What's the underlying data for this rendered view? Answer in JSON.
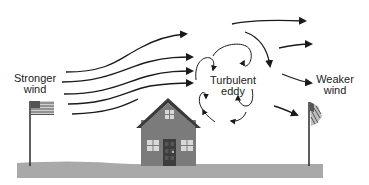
{
  "diagram": {
    "type": "illustration",
    "labels": {
      "stronger_wind": {
        "line1": "Stronger",
        "line2": "wind"
      },
      "turbulent_eddy": {
        "line1": "Turbulent",
        "line2": "eddy"
      },
      "weaker_wind": {
        "line1": "Weaker",
        "line2": "wind"
      }
    },
    "elements": [
      "stronger-wind-arrows",
      "turbulent-eddy-arrows",
      "weaker-wind-arrows",
      "house",
      "left-flag-extended",
      "right-flag-drooping",
      "ground"
    ],
    "colors": {
      "ground": "#a9a9a9",
      "house_body": "#7b7b7b",
      "roof_edge": "#3a3a3a",
      "door": "#3d3d3d",
      "window": "#d8d8d8",
      "arrow": "#1a1a1a",
      "background": "#ffffff"
    }
  }
}
